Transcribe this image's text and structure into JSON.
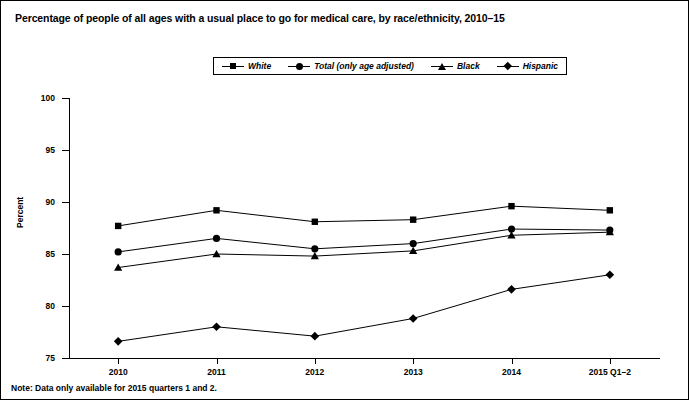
{
  "chart_data": {
    "type": "line",
    "title": "Percentage of people of all ages with a usual place to go for medical care, by race/ethnicity, 2010–15",
    "xlabel": "",
    "ylabel": "Percent",
    "categories": [
      "2010",
      "2011",
      "2012",
      "2013",
      "2014",
      "2015 Q1–2"
    ],
    "ylim": [
      75,
      100
    ],
    "yticks": [
      75,
      80,
      85,
      90,
      95,
      100
    ],
    "ytick_labels": [
      "75",
      "80",
      "85",
      "90",
      "95",
      "100"
    ],
    "grid": false,
    "legend_position": "top-center",
    "series": [
      {
        "name": "White",
        "marker": "square",
        "values": [
          87.7,
          89.2,
          88.1,
          88.3,
          89.6,
          89.2
        ]
      },
      {
        "name": "Total (only age adjusted)",
        "marker": "circle",
        "values": [
          85.2,
          86.5,
          85.5,
          86.0,
          87.4,
          87.3
        ]
      },
      {
        "name": "Black",
        "marker": "triangle",
        "values": [
          83.7,
          85.0,
          84.8,
          85.3,
          86.8,
          87.1
        ]
      },
      {
        "name": "Hispanic",
        "marker": "diamond",
        "values": [
          76.6,
          78.0,
          77.1,
          78.8,
          81.6,
          83.0
        ]
      }
    ],
    "note": "Note: Data only available for 2015 quarters 1 and 2."
  },
  "colors": {
    "line": "#000000",
    "background": "#ffffff",
    "border": "#000000"
  }
}
